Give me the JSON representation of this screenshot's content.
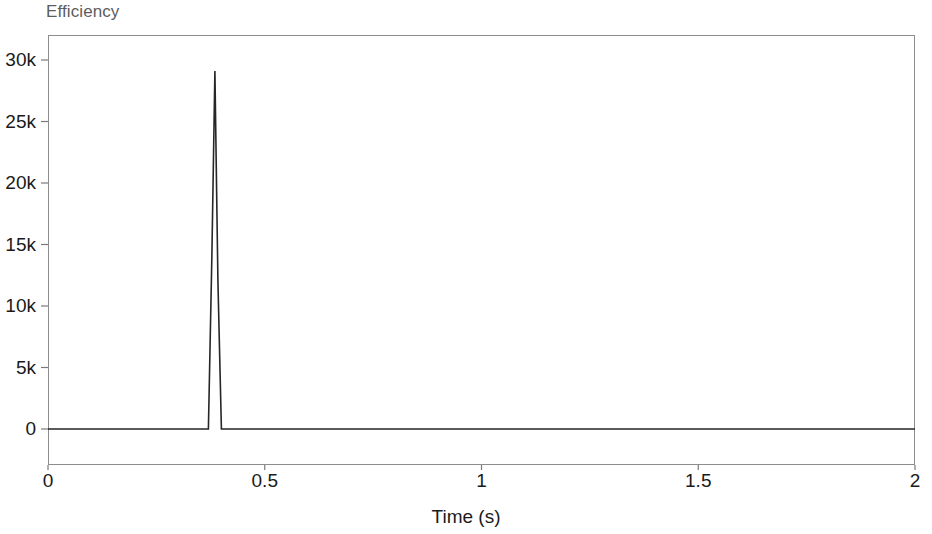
{
  "chart_data": {
    "type": "line",
    "title": "Efficiency",
    "subtitle": "",
    "xlabel": "Time (s)",
    "ylabel": "",
    "xlim": [
      0,
      2
    ],
    "ylim": [
      -1000,
      32000
    ],
    "grid": false,
    "legend": "none",
    "x_ticks": [
      "0",
      "0.5",
      "1",
      "1.5",
      "2"
    ],
    "x_tick_values": [
      0,
      0.5,
      1,
      1.5,
      2
    ],
    "y_ticks": [
      "0",
      "5k",
      "10k",
      "15k",
      "20k",
      "25k",
      "30k"
    ],
    "y_tick_values": [
      0,
      5000,
      10000,
      15000,
      20000,
      25000,
      30000
    ],
    "series": [
      {
        "name": "Efficiency",
        "color": "#262626",
        "x": [
          0,
          0.1,
          0.2,
          0.3,
          0.37,
          0.378,
          0.385,
          0.392,
          0.4,
          0.5,
          0.8,
          1.0,
          1.3,
          1.6,
          1.8,
          2.0
        ],
        "values": [
          0,
          0,
          0,
          0,
          0,
          14000,
          29100,
          12000,
          0,
          0,
          0,
          0,
          0,
          0,
          0,
          0
        ]
      }
    ],
    "annotations": [
      {
        "name": "spike",
        "x": 0.385,
        "y": 29100,
        "description": "Single narrow transient spike peaking near 29.1k at t = 0.385 s; signal is flat at 0 elsewhere."
      }
    ],
    "colors": {
      "line": "#262626",
      "frame": "#8d8d8d",
      "tick": "#7a7a7a",
      "title": "#5d5d5d",
      "text": "#1a1a1a",
      "background": "#ffffff"
    }
  },
  "geometry": {
    "plot_left": 48,
    "plot_top": 35,
    "plot_right": 915,
    "plot_bottom": 465,
    "zero_line_y": 429,
    "y_top_value_y": 60
  }
}
